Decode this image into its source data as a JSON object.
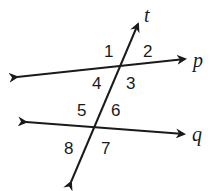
{
  "diagram": {
    "type": "parallel-lines-transversal",
    "lines": {
      "p": {
        "label": "p",
        "from": [
          17,
          77
        ],
        "to": [
          185,
          59
        ]
      },
      "q": {
        "label": "q",
        "from": [
          26,
          122
        ],
        "to": [
          184,
          134
        ]
      },
      "t": {
        "label": "t",
        "from": [
          71,
          182
        ],
        "to": [
          138,
          24
        ]
      }
    },
    "angles": [
      {
        "label": "1",
        "x": 104,
        "y": 57
      },
      {
        "label": "2",
        "x": 143,
        "y": 57
      },
      {
        "label": "4",
        "x": 92,
        "y": 89
      },
      {
        "label": "3",
        "x": 126,
        "y": 89
      },
      {
        "label": "5",
        "x": 77,
        "y": 116
      },
      {
        "label": "6",
        "x": 111,
        "y": 116
      },
      {
        "label": "8",
        "x": 64,
        "y": 154
      },
      {
        "label": "7",
        "x": 101,
        "y": 154
      }
    ],
    "line_labels": {
      "t": {
        "text": "t",
        "x": 144,
        "y": 22
      },
      "p": {
        "text": "p",
        "x": 193,
        "y": 67
      },
      "q": {
        "text": "q",
        "x": 192,
        "y": 141
      }
    },
    "stroke_color": "#1a1a1a"
  }
}
